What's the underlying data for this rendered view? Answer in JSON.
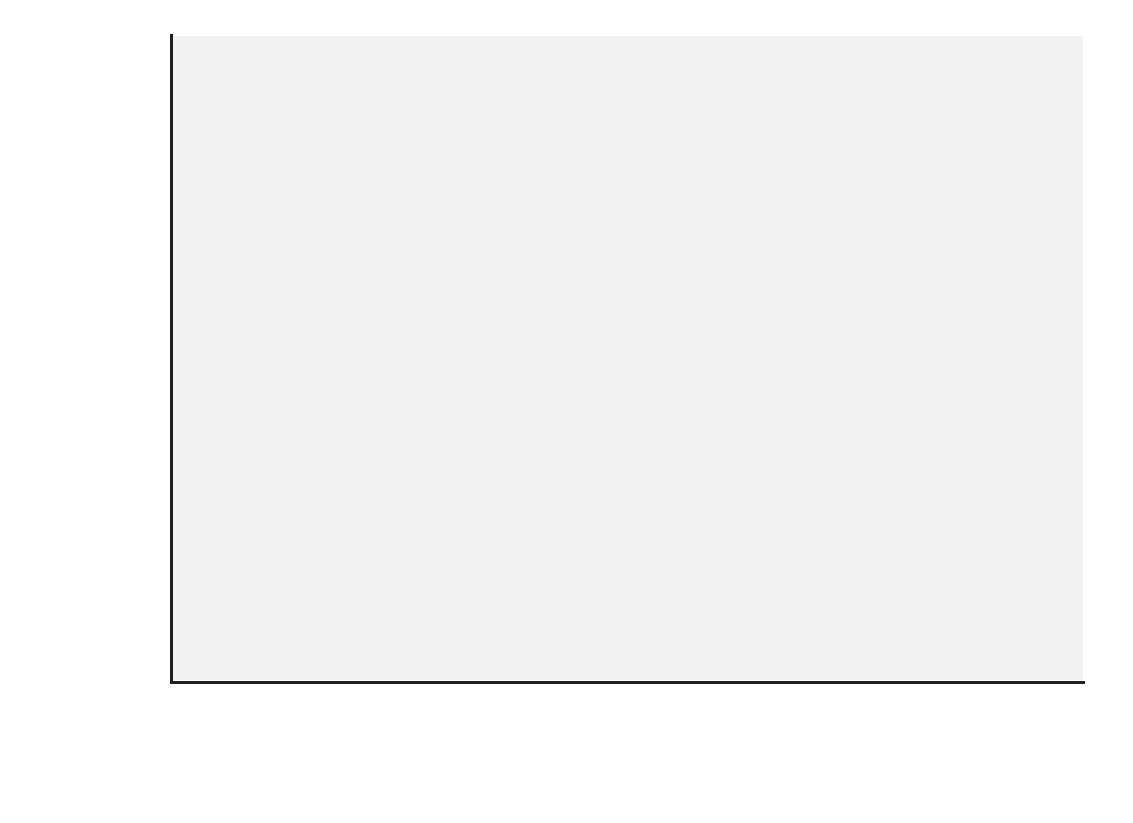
{
  "chart_data": {
    "type": "bar",
    "orientation": "horizontal",
    "stacked": true,
    "stack_total": 100,
    "xlabel": "",
    "ylabel": "",
    "xlim": [
      0,
      100
    ],
    "xticks": [
      0,
      10,
      20,
      30,
      40,
      50,
      60,
      70,
      80,
      90,
      100
    ],
    "xtick_labels": [
      "0%",
      "10%",
      "20%",
      "30%",
      "40%",
      "50%",
      "60%",
      "70%",
      "80%",
      "90%",
      "100%"
    ],
    "grid": "vertical",
    "legend_position": "bottom",
    "series": [
      {
        "name": "Respondent or partner planned sex",
        "color": "#595959"
      },
      {
        "name": "Both planned sex",
        "color": "#b5b5b5"
      },
      {
        "name": "Neither planned sex",
        "color": "#3a3a3a"
      },
      {
        "name": "Happened on spur of the moment",
        "color": "#e3e3e3"
      }
    ],
    "groups": [
      {
        "name": "Women",
        "categories": [
          "All",
          "55-64",
          "45-54",
          "35-44",
          "25-34",
          "18-24"
        ],
        "rows": [
          {
            "category": "All",
            "values": [
              3.8,
              48.7,
              7.3,
              40.2
            ]
          },
          {
            "category": "55-64",
            "values": [
              6.0,
              54.5,
              9.2,
              30.3
            ]
          },
          {
            "category": "45-54",
            "values": [
              3.8,
              48.2,
              6.8,
              41.2
            ]
          },
          {
            "category": "35-44",
            "values": [
              3.8,
              48.5,
              7.9,
              39.8
            ]
          },
          {
            "category": "25-34",
            "values": [
              2.3,
              46.2,
              5.3,
              46.2
            ]
          },
          {
            "category": "18-24",
            "values": [
              2.9,
              48.9,
              6.7,
              41.5
            ]
          }
        ]
      },
      {
        "name": "Men",
        "categories": [
          "All",
          "55-64",
          "45-54",
          "35-44",
          "25-34",
          "18-24"
        ],
        "rows": [
          {
            "category": "All",
            "values": [
              3.9,
              32.8,
              8.7,
              54.6
            ]
          },
          {
            "category": "55-64",
            "values": [
              5.3,
              37.5,
              10.8,
              46.4
            ]
          },
          {
            "category": "45-54",
            "values": [
              3.3,
              34.2,
              8.5,
              54.0
            ]
          },
          {
            "category": "35-44",
            "values": [
              3.2,
              30.8,
              7.5,
              58.5
            ]
          },
          {
            "category": "25-34",
            "values": [
              4.0,
              31.6,
              9.2,
              55.2
            ]
          },
          {
            "category": "18-24",
            "values": [
              3.3,
              32.9,
              7.6,
              56.2
            ]
          }
        ]
      }
    ]
  },
  "legend": {
    "items": [
      {
        "label": "Respondent or partner planned sex",
        "color": "#595959"
      },
      {
        "label": "Both planned sex",
        "color": "#b5b5b5"
      },
      {
        "label": "Neither planned sex",
        "color": "#3a3a3a"
      },
      {
        "label": "Happened on spur of the moment",
        "color": "#e3e3e3"
      }
    ]
  }
}
